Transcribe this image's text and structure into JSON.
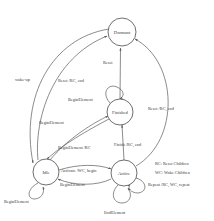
{
  "diagram": {
    "type": "state-machine",
    "background_color": "#ffffff",
    "stroke_color": "#5a5a5a",
    "text_color": "#3a3a3a",
    "states": [
      {
        "id": "dormant",
        "label": "Dormant",
        "cx": 122,
        "cy": 32,
        "r": 14
      },
      {
        "id": "finished",
        "label": "Finished",
        "cx": 120,
        "cy": 112,
        "r": 13
      },
      {
        "id": "idle",
        "label": "Idle",
        "cx": 46,
        "cy": 172,
        "r": 13
      },
      {
        "id": "active",
        "label": "Active",
        "cx": 124,
        "cy": 173,
        "r": 13
      }
    ],
    "transitions": [
      {
        "id": "t-finished-dormant",
        "label": "Reset",
        "from": "finished",
        "to": "dormant",
        "x": 103,
        "y": 64
      },
      {
        "id": "t-idle-dormant",
        "label": "Reset /RC, end",
        "from": "idle",
        "to": "dormant",
        "x": 58,
        "y": 82
      },
      {
        "id": "t-dormant-idle",
        "label": "wake-up",
        "from": "dormant",
        "to": "idle",
        "x": 15,
        "y": 81
      },
      {
        "id": "t-finished-self",
        "label": "BeginElement",
        "from": "finished",
        "to": "finished",
        "x": 68,
        "y": 101
      },
      {
        "id": "t-active-dormant",
        "label": "Reset /RC, end",
        "from": "active",
        "to": "dormant",
        "x": 148,
        "y": 110
      },
      {
        "id": "t-finished-idle",
        "label": "BeginElement",
        "from": "finished",
        "to": "idle",
        "x": 39,
        "y": 124
      },
      {
        "id": "t-active-finished",
        "label": "Finish /RC, end",
        "from": "active",
        "to": "finished",
        "x": 114,
        "y": 146
      },
      {
        "id": "t-idle-finished",
        "label": "BeginElement  /RC",
        "from": "idle",
        "to": "finished",
        "x": 58,
        "y": 149
      },
      {
        "id": "t-idle-active",
        "label": "Activate /WC, begin",
        "from": "idle",
        "to": "active",
        "x": 61,
        "y": 172
      },
      {
        "id": "t-active-idle",
        "label": "BeginElement",
        "from": "active",
        "to": "idle",
        "x": 60,
        "y": 186
      },
      {
        "id": "t-active-self-repeat",
        "label": "Repeat /RC, WC, repeat",
        "from": "active",
        "to": "active",
        "x": 148,
        "y": 186
      },
      {
        "id": "t-idle-self",
        "label": "BeginElement",
        "from": "idle",
        "to": "idle",
        "x": 4,
        "y": 203
      },
      {
        "id": "t-active-self-end",
        "label": "EndElement",
        "from": "active",
        "to": "active",
        "x": 104,
        "y": 214
      }
    ],
    "legend": [
      {
        "id": "legend-rc",
        "label": "RC: Reset Children",
        "x": 155,
        "y": 165
      },
      {
        "id": "legend-wc",
        "label": "WC: Wake Children",
        "x": 155,
        "y": 174
      }
    ]
  }
}
